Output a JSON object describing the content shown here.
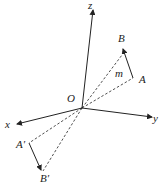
{
  "diagram": {
    "labels": {
      "z": "z",
      "y": "y",
      "x": "x",
      "O": "O",
      "A": "A",
      "B": "B",
      "m": "m",
      "A_prime": "A′",
      "B_prime": "B′"
    },
    "colors": {
      "line": "#222222",
      "background": "#ffffff"
    }
  }
}
